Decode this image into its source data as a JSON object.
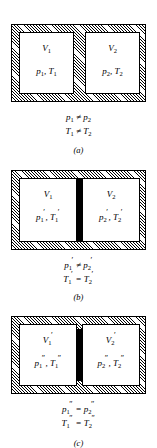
{
  "figure": {
    "type": "thermodynamics-partitioned-container",
    "panels": [
      {
        "id": "a",
        "letter": "(a)",
        "divider_style": "hatched-rigid-wall",
        "left_chamber": {
          "volume_symbol": "V",
          "volume_sub": "1",
          "volume_prime": "",
          "pressure_symbol": "p",
          "pressure_sub": "1",
          "pressure_prime": "",
          "temperature_symbol": "T",
          "temperature_sub": "1",
          "temperature_prime": "",
          "separator": ", "
        },
        "right_chamber": {
          "volume_symbol": "V",
          "volume_sub": "2",
          "volume_prime": "",
          "pressure_symbol": "p",
          "pressure_sub": "2",
          "pressure_prime": "",
          "temperature_symbol": "T",
          "temperature_sub": "2",
          "temperature_prime": "",
          "separator": ", "
        },
        "caption": {
          "pressure_line": {
            "lhs_symbol": "p",
            "lhs_sub": "1",
            "lhs_prime": "",
            "relation": " ≠ ",
            "rhs_symbol": "p",
            "rhs_sub": "2",
            "rhs_prime": ""
          },
          "temperature_line": {
            "lhs_symbol": "T",
            "lhs_sub": "1",
            "lhs_prime": "",
            "relation": " ≠ ",
            "rhs_symbol": "T",
            "rhs_sub": "2",
            "rhs_prime": ""
          }
        }
      },
      {
        "id": "b",
        "letter": "(b)",
        "divider_style": "solid-black-conducting-wall",
        "left_chamber": {
          "volume_symbol": "V",
          "volume_sub": "1",
          "volume_prime": "",
          "pressure_symbol": "p",
          "pressure_sub": "1",
          "pressure_prime": "′",
          "temperature_symbol": "T",
          "temperature_sub": "1",
          "temperature_prime": "′",
          "separator": ", "
        },
        "right_chamber": {
          "volume_symbol": "V",
          "volume_sub": "2",
          "volume_prime": "",
          "pressure_symbol": "p",
          "pressure_sub": "2",
          "pressure_prime": "′",
          "temperature_symbol": "T",
          "temperature_sub": "2",
          "temperature_prime": "′",
          "separator": ", "
        },
        "caption": {
          "pressure_line": {
            "lhs_symbol": "p",
            "lhs_sub": "1",
            "lhs_prime": "′",
            "relation": " ≠ ",
            "rhs_symbol": "p",
            "rhs_sub": "2",
            "rhs_prime": "′"
          },
          "temperature_line": {
            "lhs_symbol": "T",
            "lhs_sub": "1",
            "lhs_prime": "′",
            "relation": " = ",
            "rhs_symbol": "T",
            "rhs_sub": "2",
            "rhs_prime": "′"
          }
        }
      },
      {
        "id": "c",
        "letter": "(c)",
        "divider_style": "solid-black-movable-piston",
        "left_chamber": {
          "volume_symbol": "V",
          "volume_sub": "1",
          "volume_prime": "′",
          "pressure_symbol": "p",
          "pressure_sub": "1",
          "pressure_prime": "″",
          "temperature_symbol": "T",
          "temperature_sub": "1",
          "temperature_prime": "″",
          "separator": ", "
        },
        "right_chamber": {
          "volume_symbol": "V",
          "volume_sub": "2",
          "volume_prime": "′",
          "pressure_symbol": "p",
          "pressure_sub": "2",
          "pressure_prime": "″",
          "temperature_symbol": "T",
          "temperature_sub": "2",
          "temperature_prime": "″",
          "separator": ", "
        },
        "caption": {
          "pressure_line": {
            "lhs_symbol": "p",
            "lhs_sub": "1",
            "lhs_prime": "″",
            "relation": " = ",
            "rhs_symbol": "p",
            "rhs_sub": "2",
            "rhs_prime": "″"
          },
          "temperature_line": {
            "lhs_symbol": "T",
            "lhs_sub": "1",
            "lhs_prime": "″",
            "relation": " = ",
            "rhs_symbol": "T",
            "rhs_sub": "2",
            "rhs_prime": "″"
          }
        }
      }
    ]
  }
}
